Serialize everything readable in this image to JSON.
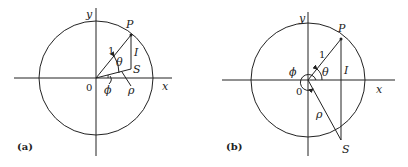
{
  "figure": {
    "panels": [
      {
        "id": "a",
        "caption": "(a)",
        "labels": {
          "y_axis": "y",
          "x_axis": "x",
          "origin": "0",
          "point_P": "P",
          "point_S": "S",
          "segment_I": "I",
          "radius": "1",
          "angle_theta": "θ",
          "angle_phi": "ϕ",
          "distance_rho": "ρ"
        }
      },
      {
        "id": "b",
        "caption": "(b)",
        "labels": {
          "y_axis": "y",
          "x_axis": "x",
          "origin": "0",
          "point_P": "P",
          "point_S": "S",
          "segment_I": "I",
          "radius": "1",
          "angle_theta": "θ",
          "angle_phi": "ϕ",
          "distance_rho": "ρ"
        }
      }
    ]
  }
}
